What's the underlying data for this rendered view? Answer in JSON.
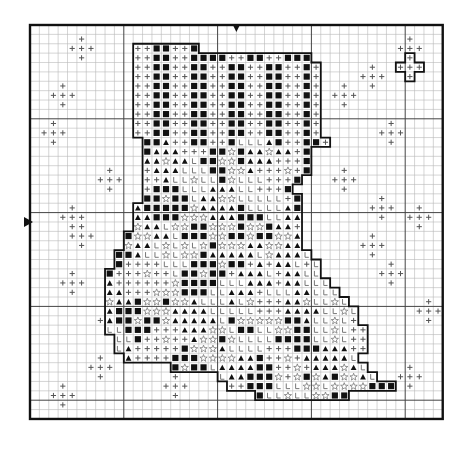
{
  "chart": {
    "title": "Cross-stitch stocking pattern",
    "origin_x": 30,
    "origin_y": 25,
    "cell": 9.38,
    "cols": 44,
    "rows": 42,
    "major_every": 10,
    "center_marker_col": 22,
    "center_marker_row": 21,
    "colors": {
      "background": "#ffffff",
      "minor_line": "#b8b8b8",
      "major_line": "#444444",
      "border": "#111111",
      "symbol": "#111111",
      "plus": "#555555",
      "star": "#777777"
    },
    "legend": {
      "+": "plus-symbol",
      "#": "filled-square-symbol",
      "^": "triangle-symbol",
      "*": "star-outline-symbol",
      "L": "letter-L-symbol",
      ".": "empty"
    },
    "grid": [
      "............................................",
      "............................................",
      "...........++##++#..........................",
      "...........++##++####++##++###..........+...",
      "...........++##++##++##++##++#+........+++..",
      "...........++##++##++##++##++#+.........+...",
      "...........++##++##++##++##++#+.............",
      "...........++##++##++##++##++#+.............",
      "...........++##++##++##++##++#+.............",
      "...........++##++##++##++##++#+.............",
      "...........++##++##++##++##++#+.............",
      "...........++##++##++##++##++#+.............",
      "............##^++##++#LLL^#++##+............",
      "............#^^^+++##*#^^*^^+#..............",
      "............^^*^^L##**#^^^+++#..............",
      "............+^^^LLL##**^+++*+#..............",
      "............++^LL*LL#*LLL+++#...............",
      "............+###LLL^^^LL+++#................",
      "............##*##L^^**LLLLL+#...............",
      "...........^#####*^^^^#LLLL^#...............",
      "...........^^###***^^^###LL^^...............",
      "...........*^^L**##***#**#^^+...............",
      "..........#**^^L###**##*##**^...............",
      "..........*^^L*L*L*#***^^**^^...............",
      ".........##^LL*L**#^^^^^L*^^^L..............",
      ".........#++++LLL###*##+^+^^L+L.............",
      "........#+++*++L##*##+^^^L+^^LL.............",
      "........^++++++*####LLL^^^+^^LLL............",
      "........^^+++***###LL^^^+LLL^^LLL...........",
      "........*^^#**#**^LLL^L*+++^^*LL*L..........",
      "........^###***^^^^LLLLL+++^^^^LL*L.........",
      "........^##*##*^^^^^L#*****##^LL*L+.........",
      "........LL###+++^^^**L##LL**##LL*L++........",
      ".........LL#++*++^**#*LLLL####LL*L++........",
      ".........L^+++++#***^LLLL+++###^^^++........",
      "..........^++++###****^^#++*+^^^^^L.........",
      "...............#*##L^^^^##++*+^^^*^L........",
      "....................L^^###*+*#*^#**^L.......",
      ".....................++###LLL**L****###.....",
      "........................#LL*LL**##..........",
      "............................................",
      "............................................"
    ],
    "scatter_plus_centers": [
      [
        5,
        2
      ],
      [
        3,
        7
      ],
      [
        2,
        11
      ],
      [
        8,
        16
      ],
      [
        4,
        20
      ],
      [
        5,
        22
      ],
      [
        4,
        27
      ],
      [
        8,
        31
      ],
      [
        7,
        36
      ],
      [
        3,
        39
      ],
      [
        15,
        38
      ],
      [
        36,
        5
      ],
      [
        40,
        2
      ],
      [
        33,
        7
      ],
      [
        38,
        11
      ],
      [
        33,
        16
      ],
      [
        37,
        19
      ],
      [
        36,
        23
      ],
      [
        41,
        20
      ],
      [
        38,
        26
      ],
      [
        42,
        30
      ],
      [
        40,
        37
      ]
    ],
    "border_arrows": [
      {
        "name": "top-center-arrow",
        "col": 22,
        "side": "top"
      },
      {
        "name": "left-center-arrow",
        "row": 21,
        "side": "left"
      }
    ]
  }
}
